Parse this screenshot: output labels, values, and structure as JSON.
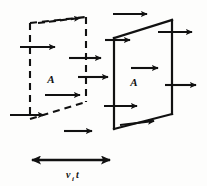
{
  "figure": {
    "background_color": "#fdfdfc",
    "ink_color": "#111111",
    "labels": {
      "area_left": "A",
      "area_right": "A",
      "distance_var": "v",
      "distance_sub": "i",
      "distance_time": "t",
      "distance_full": "v_i t"
    },
    "shapes": {
      "left_quad": {
        "name": "dashed-area-initial",
        "style": "dashed",
        "points": "30,23 86,17 86,102 30,119"
      },
      "right_quad": {
        "name": "solid-area-final",
        "style": "solid",
        "points": "114,38 172,20 172,114 114,129"
      }
    },
    "flow_arrows": [
      {
        "id": "arrow-top-left-dashed",
        "x1": 38,
        "y1": 23,
        "x2": 82,
        "y2": 18,
        "style": "dashed"
      },
      {
        "id": "arrow-top-right-solid",
        "x1": 113,
        "y1": 14,
        "x2": 149,
        "y2": 14,
        "style": "solid"
      },
      {
        "id": "arrow-left-upper",
        "x1": 20,
        "y1": 47,
        "x2": 57,
        "y2": 47,
        "style": "solid"
      },
      {
        "id": "arrow-mid-upper",
        "x1": 69,
        "y1": 58,
        "x2": 103,
        "y2": 58,
        "style": "solid"
      },
      {
        "id": "arrow-inflow-upper",
        "x1": 105,
        "y1": 40,
        "x2": 132,
        "y2": 40,
        "style": "solid"
      },
      {
        "id": "arrow-outflow-upper",
        "x1": 158,
        "y1": 32,
        "x2": 194,
        "y2": 32,
        "style": "solid"
      },
      {
        "id": "arrow-mid-center",
        "x1": 78,
        "y1": 77,
        "x2": 110,
        "y2": 77,
        "style": "solid"
      },
      {
        "id": "arrow-inner-center",
        "x1": 131,
        "y1": 68,
        "x2": 160,
        "y2": 68,
        "style": "solid"
      },
      {
        "id": "arrow-left-lower-inner",
        "x1": 45,
        "y1": 95,
        "x2": 82,
        "y2": 95,
        "style": "solid"
      },
      {
        "id": "arrow-outflow-lower",
        "x1": 165,
        "y1": 85,
        "x2": 198,
        "y2": 85,
        "style": "solid"
      },
      {
        "id": "arrow-left-bottom",
        "x1": 10,
        "y1": 115,
        "x2": 46,
        "y2": 115,
        "style": "solid"
      },
      {
        "id": "arrow-inflow-lower",
        "x1": 104,
        "y1": 106,
        "x2": 139,
        "y2": 106,
        "style": "solid"
      },
      {
        "id": "arrow-bottom-dashed",
        "x1": 64,
        "y1": 131,
        "x2": 94,
        "y2": 131,
        "style": "solid"
      },
      {
        "id": "arrow-bottom-solid-face",
        "x1": 120,
        "y1": 125,
        "x2": 156,
        "y2": 121,
        "style": "solid"
      }
    ],
    "dimension_arrow": {
      "id": "distance-dimension",
      "x1": 32,
      "x2": 110,
      "y": 160,
      "double_headed": true
    }
  }
}
